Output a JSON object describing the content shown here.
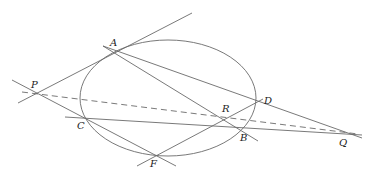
{
  "diagram": {
    "type": "projective-geometry",
    "colors": {
      "stroke": "#6a6a6a",
      "label": "#222222",
      "background": "#ffffff"
    },
    "ellipse": {
      "cx": 168,
      "cy": 98,
      "rx": 88,
      "ry": 58
    },
    "points": [
      {
        "name": "A",
        "x": 116,
        "y": 50,
        "lx": 110,
        "ly": 46
      },
      {
        "name": "P",
        "x": 37,
        "y": 93,
        "lx": 31,
        "ly": 88
      },
      {
        "name": "C",
        "x": 85,
        "y": 119,
        "lx": 77,
        "ly": 129
      },
      {
        "name": "F",
        "x": 155,
        "y": 155,
        "lx": 150,
        "ly": 167
      },
      {
        "name": "B",
        "x": 240,
        "y": 129,
        "lx": 240,
        "ly": 141
      },
      {
        "name": "R",
        "x": 226,
        "y": 118,
        "lx": 222,
        "ly": 112
      },
      {
        "name": "D",
        "x": 256,
        "y": 103,
        "lx": 264,
        "ly": 104
      },
      {
        "name": "Q",
        "x": 342,
        "y": 133,
        "lx": 339,
        "ly": 146
      }
    ],
    "lines": [
      {
        "id": "tangent-at-A",
        "x1": 18,
        "y1": 103,
        "x2": 192,
        "y2": 13,
        "dashed": false
      },
      {
        "id": "line-P-C-F",
        "x1": 12,
        "y1": 80,
        "x2": 176,
        "y2": 166,
        "dashed": false
      },
      {
        "id": "line-A-R-B",
        "x1": 103,
        "y1": 46,
        "x2": 258,
        "y2": 141,
        "dashed": false
      },
      {
        "id": "line-A-D-Q",
        "x1": 103,
        "y1": 46,
        "x2": 362,
        "y2": 138,
        "dashed": false
      },
      {
        "id": "line-C-B-Q",
        "x1": 65,
        "y1": 117,
        "x2": 362,
        "y2": 135,
        "dashed": false
      },
      {
        "id": "line-F-R-D",
        "x1": 137,
        "y1": 166,
        "x2": 263,
        "y2": 99,
        "dashed": false
      },
      {
        "id": "line-P-Q",
        "x1": 22,
        "y1": 92,
        "x2": 358,
        "y2": 134,
        "dashed": true
      }
    ],
    "labels": {
      "A": "A",
      "P": "P",
      "C": "C",
      "F": "F",
      "B": "B",
      "R": "R",
      "D": "D",
      "Q": "Q"
    }
  }
}
